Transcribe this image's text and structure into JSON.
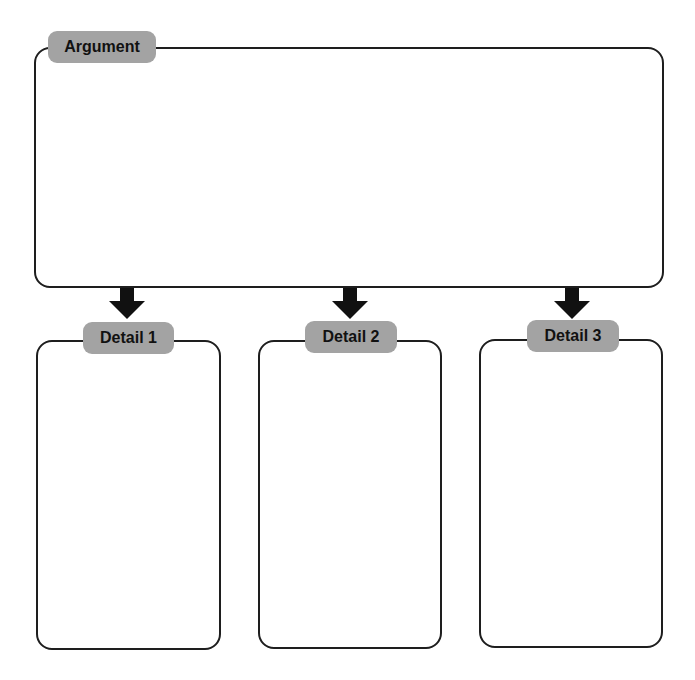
{
  "diagram": {
    "main": {
      "label": "Argument"
    },
    "details": [
      {
        "label": "Detail 1"
      },
      {
        "label": "Detail 2"
      },
      {
        "label": "Detail 3"
      }
    ]
  },
  "colors": {
    "stroke": "#1e1e1e",
    "label_fill": "#a3a3a3",
    "label_text": "#111111",
    "background": "#ffffff"
  }
}
